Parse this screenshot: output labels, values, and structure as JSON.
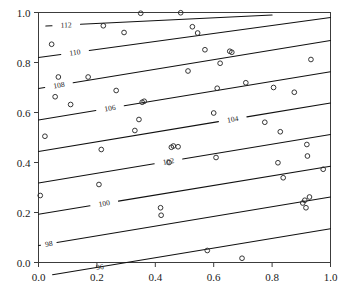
{
  "chart_data": {
    "type": "line",
    "title": "",
    "subtitle": "",
    "xlabel": "",
    "ylabel": "",
    "xlim": [
      0.0,
      1.0
    ],
    "ylim": [
      0.0,
      1.0
    ],
    "grid": false,
    "legend": "none",
    "x_ticks": [
      "0.0",
      "0.2",
      "0.4",
      "0.6",
      "0.8",
      "1.0"
    ],
    "x_tick_values": [
      0.0,
      0.2,
      0.4,
      0.6,
      0.8,
      1.0
    ],
    "y_ticks": [
      "0.0",
      "0.2",
      "0.4",
      "0.6",
      "0.8",
      "1.0"
    ],
    "y_tick_values": [
      0.0,
      0.2,
      0.4,
      0.6,
      0.8,
      1.0
    ],
    "contour_levels": [
      96,
      98,
      100,
      102,
      104,
      106,
      108,
      110,
      112
    ],
    "contour_lines": [
      {
        "label": "96",
        "x0": 0.395,
        "y0": 0.018,
        "x1": 1.0,
        "y1": 0.135,
        "label_pos": 0.4,
        "label_frac": 0.02,
        "clip_left": true
      },
      {
        "label": "98",
        "x0": 0.0,
        "y0": 0.068,
        "x1": 1.0,
        "y1": 0.262,
        "label_pos": 0.035,
        "label_frac": 0.035,
        "clip_left": false
      },
      {
        "label": "100",
        "x0": 0.0,
        "y0": 0.193,
        "x1": 1.0,
        "y1": 0.385,
        "label_pos": 0.215,
        "label_frac": 0.235,
        "clip_left": false
      },
      {
        "label": "102",
        "x0": 0.0,
        "y0": 0.318,
        "x1": 1.0,
        "y1": 0.512,
        "label_pos": 0.435,
        "label_frac": 0.455,
        "clip_left": false
      },
      {
        "label": "104",
        "x0": 0.0,
        "y0": 0.444,
        "x1": 1.0,
        "y1": 0.638,
        "label_pos": 0.655,
        "label_frac": 0.675,
        "clip_left": false
      },
      {
        "label": "106",
        "x0": 0.0,
        "y0": 0.57,
        "x1": 1.0,
        "y1": 0.763,
        "label_pos": 0.235,
        "label_frac": 0.255,
        "clip_left": false
      },
      {
        "label": "108",
        "x0": 0.0,
        "y0": 0.696,
        "x1": 1.0,
        "y1": 0.888,
        "label_pos": 0.06,
        "label_frac": 0.08,
        "clip_left": false
      },
      {
        "label": "110",
        "x0": 0.0,
        "y0": 0.82,
        "x1": 1.0,
        "y1": 0.98,
        "label_pos": 0.115,
        "label_frac": 0.135,
        "clip_left": false
      },
      {
        "label": "112",
        "x0": 0.025,
        "y0": 0.946,
        "x1": 0.8,
        "y1": 0.99,
        "label_pos": 0.085,
        "label_frac": 0.105,
        "clip_left": true
      }
    ],
    "scatter": {
      "marker": "open-circle",
      "n": 60,
      "points": [
        [
          0.045,
          0.873
        ],
        [
          0.022,
          0.505
        ],
        [
          0.006,
          0.268
        ],
        [
          0.068,
          0.742
        ],
        [
          0.057,
          0.663
        ],
        [
          0.11,
          0.632
        ],
        [
          0.17,
          0.742
        ],
        [
          0.215,
          0.452
        ],
        [
          0.207,
          0.312
        ],
        [
          0.222,
          0.947
        ],
        [
          0.266,
          0.688
        ],
        [
          0.293,
          0.92
        ],
        [
          0.33,
          0.528
        ],
        [
          0.344,
          0.572
        ],
        [
          0.35,
          0.997
        ],
        [
          0.355,
          0.641
        ],
        [
          0.362,
          0.645
        ],
        [
          0.418,
          0.219
        ],
        [
          0.42,
          0.189
        ],
        [
          0.447,
          0.4
        ],
        [
          0.455,
          0.461
        ],
        [
          0.462,
          0.466
        ],
        [
          0.478,
          0.463
        ],
        [
          0.487,
          0.999
        ],
        [
          0.512,
          0.766
        ],
        [
          0.527,
          0.943
        ],
        [
          0.545,
          0.918
        ],
        [
          0.57,
          0.851
        ],
        [
          0.578,
          0.048
        ],
        [
          0.6,
          0.598
        ],
        [
          0.608,
          0.42
        ],
        [
          0.612,
          0.697
        ],
        [
          0.622,
          0.797
        ],
        [
          0.655,
          0.845
        ],
        [
          0.662,
          0.841
        ],
        [
          0.697,
          0.017
        ],
        [
          0.71,
          0.719
        ],
        [
          0.775,
          0.561
        ],
        [
          0.805,
          0.7
        ],
        [
          0.82,
          0.399
        ],
        [
          0.828,
          0.523
        ],
        [
          0.838,
          0.339
        ],
        [
          0.876,
          0.681
        ],
        [
          0.905,
          0.238
        ],
        [
          0.912,
          0.249
        ],
        [
          0.916,
          0.219
        ],
        [
          0.919,
          0.472
        ],
        [
          0.921,
          0.426
        ],
        [
          0.928,
          0.262
        ],
        [
          0.933,
          0.812
        ],
        [
          0.975,
          0.373
        ]
      ]
    }
  },
  "axes": {
    "frame_color": "#3c3c3c",
    "line_color": "#111111",
    "marker_color": "#2b2b2b",
    "text_color": "#1a1a1a"
  }
}
